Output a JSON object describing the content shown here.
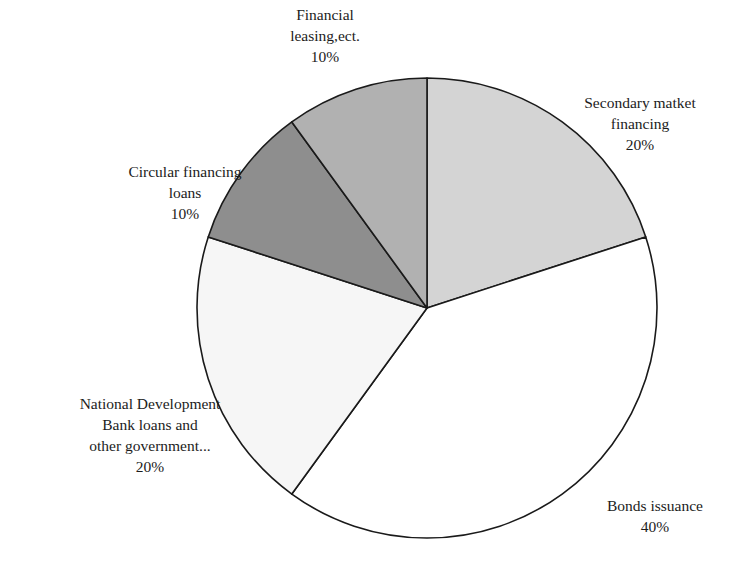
{
  "chart_data": {
    "type": "pie",
    "title": "",
    "start_angle_deg": 0,
    "direction": "clockwise",
    "slices": [
      {
        "name": "Secondary matket financing",
        "value": 20,
        "label_lines": [
          "Secondary matket",
          "financing"
        ],
        "pct": "20%",
        "color": "#d4d4d4"
      },
      {
        "name": "Bonds issuance",
        "value": 40,
        "label_lines": [
          "Bonds issuance"
        ],
        "pct": "40%",
        "color": "#ffffff"
      },
      {
        "name": "National Development Bank loans and other government...",
        "value": 20,
        "label_lines": [
          "National Development",
          "Bank loans and",
          "other government..."
        ],
        "pct": "20%",
        "color": "#f6f6f6"
      },
      {
        "name": "Circular financing loans",
        "value": 10,
        "label_lines": [
          "Circular financing",
          "loans"
        ],
        "pct": "10%",
        "color": "#8e8e8e"
      },
      {
        "name": "Financial leasing,ect.",
        "value": 10,
        "label_lines": [
          "Financial",
          "leasing,ect."
        ],
        "pct": "10%",
        "color": "#b1b1b1"
      }
    ],
    "legend": "none",
    "stroke_color": "#1a1a1a"
  }
}
